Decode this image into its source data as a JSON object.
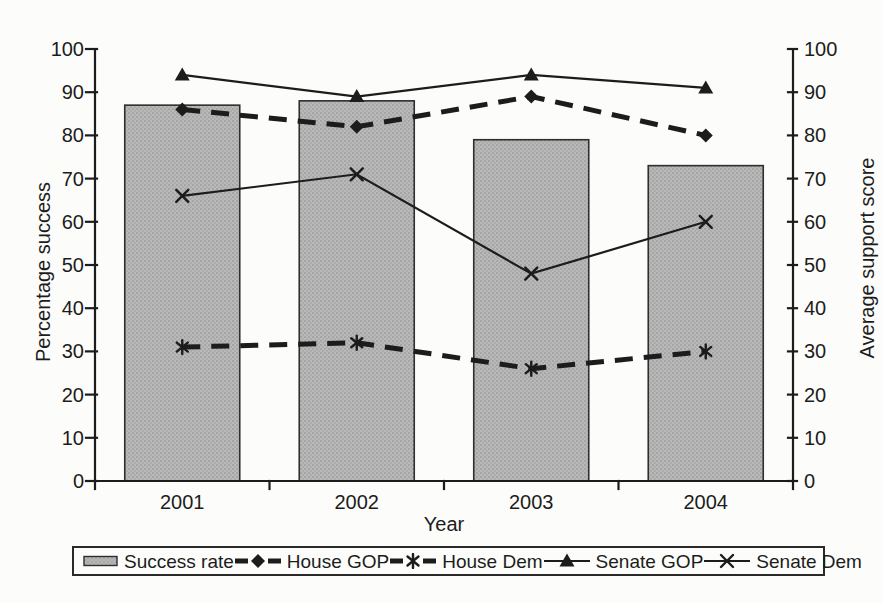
{
  "palette": {
    "ink": "#1c1c1c",
    "bar_fill": "#b3b3b3",
    "bar_dot": "#9c9c9c",
    "bar_border": "#2e2e2e",
    "paper": "#fcfcfa",
    "legend_border": "#2a2a2a"
  },
  "chart_data": {
    "type": "combo-bar-line",
    "title": "",
    "xlabel": "Year",
    "ylabel_left": "Percentage success",
    "ylabel_right": "Average support score",
    "categories": [
      "2001",
      "2002",
      "2003",
      "2004"
    ],
    "series": [
      {
        "name": "Success rate",
        "type": "bar",
        "axis": "left",
        "values": [
          87,
          88,
          79,
          73
        ]
      },
      {
        "name": "House GOP",
        "type": "line",
        "axis": "right",
        "line_style": "dashed-thick",
        "marker": "diamond",
        "values": [
          86,
          82,
          89,
          80
        ]
      },
      {
        "name": "House Dem",
        "type": "line",
        "axis": "right",
        "line_style": "dashed-thick",
        "marker": "asterisk",
        "values": [
          31,
          32,
          26,
          30
        ]
      },
      {
        "name": "Senate GOP",
        "type": "line",
        "axis": "right",
        "line_style": "solid-thin",
        "marker": "triangle",
        "values": [
          94,
          89,
          94,
          91
        ]
      },
      {
        "name": "Senate Dem",
        "type": "line",
        "axis": "right",
        "line_style": "solid-thin",
        "marker": "x",
        "values": [
          66,
          71,
          48,
          60
        ]
      }
    ],
    "ylim_left": [
      0,
      100
    ],
    "ylim_right": [
      0,
      100
    ],
    "yticks": [
      0,
      10,
      20,
      30,
      40,
      50,
      60,
      70,
      80,
      90,
      100
    ],
    "grid": false,
    "legend_position": "bottom"
  }
}
